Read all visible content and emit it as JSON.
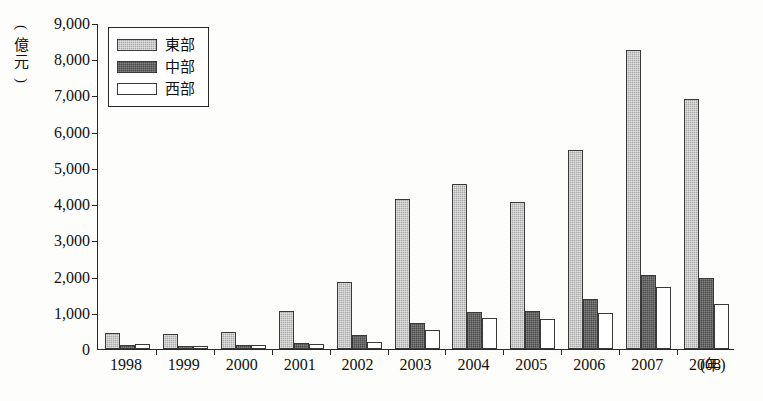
{
  "chart_data": {
    "type": "bar",
    "title": "",
    "xlabel": "(年)",
    "ylabel": "(億元)",
    "ylim": [
      0,
      9000
    ],
    "grid": false,
    "legend_position": "top-left",
    "categories": [
      "1998",
      "1999",
      "2000",
      "2001",
      "2002",
      "2003",
      "2004",
      "2005",
      "2006",
      "2007",
      "2008"
    ],
    "ytick_labels": [
      "9,000",
      "8,000",
      "7,000",
      "6,000",
      "5,000",
      "4,000",
      "3,000",
      "2,000",
      "1,000",
      "0"
    ],
    "ytick_values": [
      9000,
      8000,
      7000,
      6000,
      5000,
      4000,
      3000,
      2000,
      1000,
      0
    ],
    "series": [
      {
        "name": "東部",
        "color": "#a9a9a9",
        "values": [
          450,
          420,
          470,
          1050,
          1850,
          4150,
          4550,
          4050,
          5500,
          8250,
          6900
        ]
      },
      {
        "name": "中部",
        "color": "#4b4b4b",
        "values": [
          100,
          95,
          120,
          160,
          400,
          730,
          1030,
          1050,
          1380,
          2050,
          1950
        ]
      },
      {
        "name": "西部",
        "color": "#ffffff",
        "values": [
          130,
          90,
          110,
          130,
          200,
          530,
          870,
          830,
          1000,
          1700,
          1250
        ]
      }
    ]
  },
  "axis": {
    "unit_y_open_paren": "(",
    "unit_y_char1": "億",
    "unit_y_char2": "元",
    "unit_y_close_paren": ")",
    "unit_x_open_paren": "(",
    "unit_x_char": "年",
    "unit_x_close_paren": ")"
  }
}
